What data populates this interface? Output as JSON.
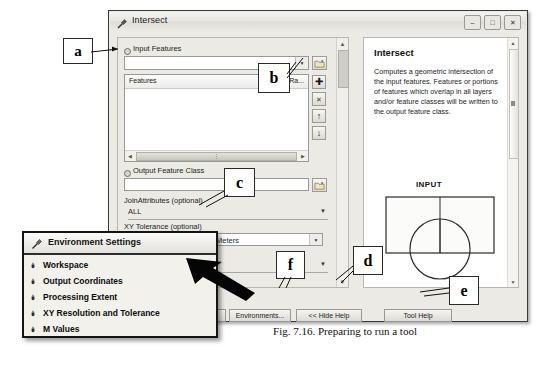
{
  "figure": {
    "caption": "Fig. 7.16. Preparing to run a tool"
  },
  "tool_window": {
    "title": "Intersect",
    "title_icon": "hammer-tool-icon",
    "window_buttons": [
      {
        "name": "minimize-button",
        "glyph": "–"
      },
      {
        "name": "maximize-button",
        "glyph": "□"
      },
      {
        "name": "close-button",
        "glyph": "✕"
      }
    ],
    "parameters": {
      "input_features_label": "Input Features",
      "input_features_value": "",
      "features_list": {
        "col_features": "Features",
        "col_ranks": "Ra...",
        "rows": []
      },
      "output_feature_class_label": "Output Feature Class",
      "output_feature_class_value": "",
      "join_attributes_label": "JoinAttributes (optional)",
      "join_attributes_value": "ALL",
      "xy_tolerance_label": "XY Tolerance (optional)",
      "xy_tolerance_value": "",
      "xy_tolerance_units": "Meters",
      "output_type_value": ""
    },
    "side_buttons": [
      {
        "name": "add-feature-button",
        "glyph": "✚"
      },
      {
        "name": "remove-feature-button",
        "glyph": "✕"
      },
      {
        "name": "move-up-button",
        "glyph": "↑"
      },
      {
        "name": "move-down-button",
        "glyph": "↓"
      }
    ],
    "browse_buttons": [
      {
        "name": "browse-input-features-button",
        "icon": "folder-open-icon"
      },
      {
        "name": "browse-output-feature-class-button",
        "icon": "folder-open-icon"
      }
    ],
    "help": {
      "title": "Intersect",
      "body": "Computes a geometric intersection of the input features. Features or portions of features which overlap in all layers and/or feature classes will be written to the output feature class.",
      "diagram_label": "INPUT"
    },
    "buttons": {
      "ok": "OK",
      "environments": "Environments...",
      "hide_help": "<< Hide Help",
      "tool_help": "Tool Help"
    }
  },
  "env_window": {
    "title": "Environment Settings",
    "title_icon": "gear-tool-icon",
    "items": [
      {
        "label": "Workspace"
      },
      {
        "label": "Output Coordinates"
      },
      {
        "label": "Processing Extent"
      },
      {
        "label": "XY Resolution and Tolerance"
      },
      {
        "label": "M Values"
      }
    ]
  },
  "callouts": [
    {
      "id": "a",
      "letter": "a"
    },
    {
      "id": "b",
      "letter": "b"
    },
    {
      "id": "c",
      "letter": "c"
    },
    {
      "id": "d",
      "letter": "d"
    },
    {
      "id": "e",
      "letter": "e"
    },
    {
      "id": "f",
      "letter": "f"
    }
  ],
  "colors": {
    "window_bg": "#eceae4",
    "border": "#3a3a3a",
    "panel_white": "#ffffff"
  }
}
